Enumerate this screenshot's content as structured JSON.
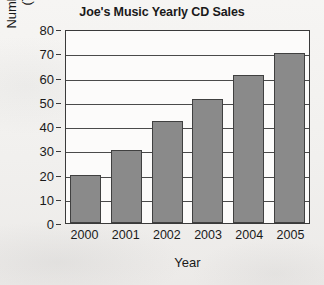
{
  "chart_data": {
    "type": "bar",
    "title": "Joe's Music Yearly CD Sales",
    "xlabel": "Year",
    "ylabel_line1": "Number of CDs Sold",
    "ylabel_line2": "(Thousands)",
    "categories": [
      "2000",
      "2001",
      "2002",
      "2003",
      "2004",
      "2005"
    ],
    "values": [
      20,
      30,
      42,
      51,
      61,
      70
    ],
    "ylim": [
      0,
      80
    ],
    "ytick_labels": [
      "0",
      "10",
      "20",
      "30",
      "40",
      "50",
      "60",
      "70",
      "80"
    ],
    "ytick_values": [
      0,
      10,
      20,
      30,
      40,
      50,
      60,
      70,
      80
    ],
    "grid": true,
    "legend": "none",
    "colors": {
      "bar_fill": "#8a8a8a",
      "bar_border": "#404040",
      "axis": "#3a3a3a",
      "gridline": "#4a4a4a",
      "plot_background": "#fcfbfa",
      "page_background": "#f2f1ef",
      "text": "#1a1a1a"
    }
  }
}
